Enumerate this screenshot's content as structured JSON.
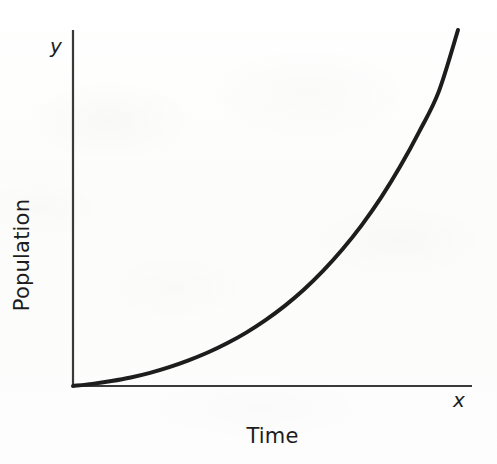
{
  "figure": {
    "background_color": "#fdfdfc",
    "ink_color": "#1d1d1d",
    "axis_color": "#3a3a3a"
  },
  "labels": {
    "y_axis_variable": "y",
    "x_axis_variable": "x",
    "y_axis_title": "Population",
    "x_axis_title": "Time"
  },
  "chart_data": {
    "type": "line",
    "title": "",
    "subtitle": "",
    "xlabel": "Time",
    "ylabel": "Population",
    "x_variable": "x",
    "y_variable": "y",
    "grid": false,
    "legend": false,
    "legend_position": "none",
    "axis_style": "open-L-axes-with-arrow-free-ends",
    "xlim": [
      0,
      1
    ],
    "ylim": [
      0,
      1
    ],
    "x_tick_labels": [],
    "y_tick_labels": [],
    "annotations": [],
    "series": [
      {
        "name": "Population over time",
        "curve": "exponential",
        "line_color": "#1d1d1d",
        "line_width_px": 4,
        "x": [
          0.0,
          0.05,
          0.1,
          0.15,
          0.2,
          0.25,
          0.3,
          0.35,
          0.4,
          0.45,
          0.5,
          0.55,
          0.6,
          0.65,
          0.7,
          0.75,
          0.8,
          0.85,
          0.9,
          0.95,
          1.0
        ],
        "values": [
          0.0,
          0.006,
          0.014,
          0.024,
          0.037,
          0.053,
          0.072,
          0.094,
          0.12,
          0.15,
          0.185,
          0.225,
          0.271,
          0.324,
          0.384,
          0.452,
          0.529,
          0.617,
          0.716,
          0.827,
          1.0
        ]
      }
    ]
  },
  "geometry": {
    "origin_px": [
      73,
      386
    ],
    "y_axis_top_px": [
      73,
      30
    ],
    "x_axis_right_px": [
      472,
      386
    ],
    "curve_end_px": [
      458,
      30
    ]
  }
}
